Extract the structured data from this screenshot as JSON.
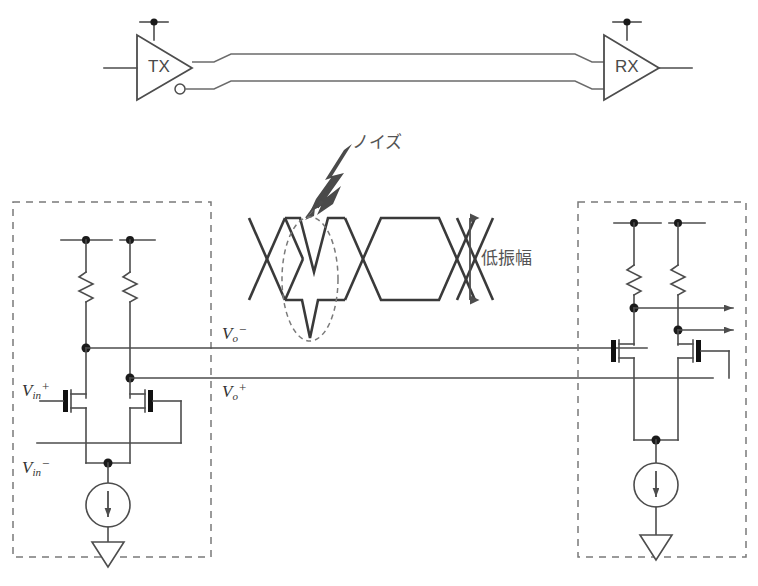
{
  "figure": {
    "line_color": "#4d4d4d",
    "eye_color": "#3a3a3a",
    "dash_color": "#7a7a7a"
  },
  "link": {
    "tx_label": "TX",
    "rx_label": "RX"
  },
  "annotations": {
    "noise": "ノイズ",
    "low_amplitude": "低振幅"
  },
  "signals": {
    "vin_p": {
      "base": "V",
      "sub": "in",
      "sup": "+"
    },
    "vin_n": {
      "base": "V",
      "sub": "in",
      "sup": "−"
    },
    "vo_p": {
      "base": "V",
      "sub": "o",
      "sup": "+"
    },
    "vo_n": {
      "base": "V",
      "sub": "o",
      "sup": "−"
    }
  },
  "blocks": {
    "transmitter": "transmitter-block",
    "receiver": "receiver-block"
  }
}
